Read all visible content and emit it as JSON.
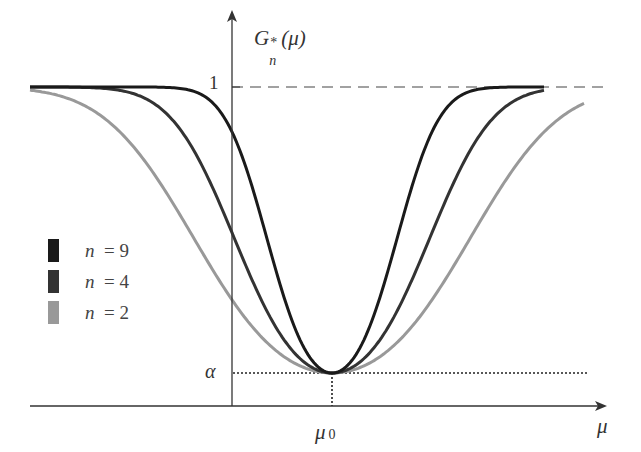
{
  "chart_data": {
    "type": "line",
    "title": "",
    "xlabel": "μ",
    "ylabel": "G*_n(μ)",
    "y_ticks": [
      {
        "label": "α",
        "value": 0.05
      },
      {
        "label": "1",
        "value": 1
      }
    ],
    "x_ticks": [
      {
        "label": "μ0",
        "value": 0
      }
    ],
    "xlim": [
      -3,
      3.7
    ],
    "ylim": [
      0,
      1.1
    ],
    "grid": false,
    "legend_position": "left-middle",
    "reference_lines": [
      {
        "type": "horizontal-dashed",
        "value": 1
      },
      {
        "type": "horizontal-dotted",
        "value": 0.05,
        "from": 0,
        "to": 3.7
      },
      {
        "type": "vertical-dotted",
        "at": "μ0"
      }
    ],
    "series": [
      {
        "name": "n = 9",
        "n": 9,
        "color": "#1a1a1a",
        "x_range": [
          -3.0,
          2.1
        ]
      },
      {
        "name": "n = 4",
        "n": 4,
        "color": "#333333",
        "x_range": [
          -3.0,
          2.1
        ]
      },
      {
        "name": "n = 2",
        "n": 2,
        "color": "#999999",
        "x_range": [
          -3.0,
          2.5
        ]
      }
    ]
  },
  "axes": {
    "y_label_main": "G",
    "y_label_sub": "n",
    "y_label_sup": "*",
    "y_label_arg": "(μ)",
    "x_label": "μ",
    "tick_one": "1",
    "tick_alpha": "α",
    "tick_mu0_main": "μ",
    "tick_mu0_sub": "0"
  },
  "legend": [
    {
      "var": "n",
      "eq": "= 9",
      "color": "#1a1a1a"
    },
    {
      "var": "n",
      "eq": "= 4",
      "color": "#333333"
    },
    {
      "var": "n",
      "eq": "= 2",
      "color": "#999999"
    }
  ]
}
